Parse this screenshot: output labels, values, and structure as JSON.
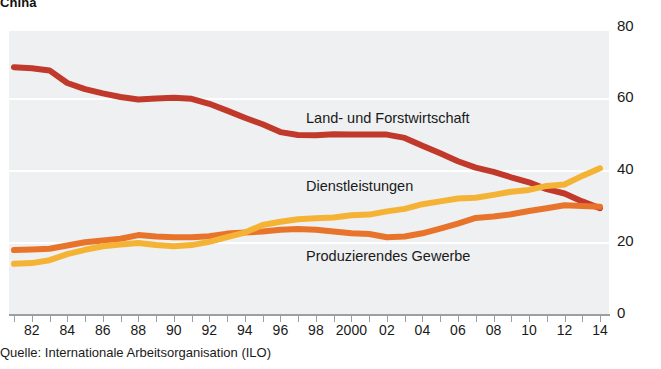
{
  "title": "China",
  "source_note": "Quelle: Internationale Arbeitsorganisation (ILO)",
  "series_labels": {
    "agriculture": "Land- und Forstwirtschaft",
    "services": "Dienstleistungen",
    "industry": "Produzierendes Gewerbe"
  },
  "colors": {
    "agriculture": "#c0392b",
    "services": "#f5b335",
    "industry": "#e8742c",
    "plot_background": "#eef0f1",
    "gridline": "#ffffff",
    "axis": "#9a9fa3"
  },
  "axes": {
    "y_ticks": [
      "80",
      "60",
      "40",
      "20",
      "0"
    ],
    "x_ticks": [
      "82",
      "84",
      "86",
      "88",
      "90",
      "92",
      "94",
      "96",
      "98",
      "2000",
      "02",
      "04",
      "06",
      "08",
      "10",
      "12",
      "14"
    ]
  },
  "chart_data": {
    "type": "line",
    "title": "China",
    "xlabel": "",
    "ylabel": "",
    "ylim": [
      0,
      80
    ],
    "grid": true,
    "legend_position": "inline-labels",
    "annotation": "Quelle: Internationale Arbeitsorganisation (ILO)",
    "x": [
      1981,
      1982,
      1983,
      1984,
      1985,
      1986,
      1987,
      1988,
      1989,
      1990,
      1991,
      1992,
      1993,
      1994,
      1995,
      1996,
      1997,
      1998,
      1999,
      2000,
      2001,
      2002,
      2003,
      2004,
      2005,
      2006,
      2007,
      2008,
      2009,
      2010,
      2011,
      2012,
      2013,
      2014
    ],
    "x_tick_labels": [
      "82",
      "84",
      "86",
      "88",
      "90",
      "92",
      "94",
      "96",
      "98",
      "2000",
      "02",
      "04",
      "06",
      "08",
      "10",
      "12",
      "14"
    ],
    "series": [
      {
        "name": "Land- und Forstwirtschaft",
        "color": "#c0392b",
        "values": [
          68.8,
          68.5,
          67.9,
          64.4,
          62.7,
          61.5,
          60.5,
          59.8,
          60.1,
          60.3,
          60.0,
          58.6,
          56.7,
          54.7,
          52.9,
          50.7,
          49.9,
          49.8,
          50.1,
          50.0,
          50.0,
          50.0,
          49.1,
          46.9,
          44.8,
          42.6,
          40.8,
          39.6,
          38.1,
          36.7,
          34.8,
          33.6,
          31.4,
          29.5
        ]
      },
      {
        "name": "Dienstleistungen",
        "color": "#f5b335",
        "values": [
          14.0,
          14.2,
          15.0,
          16.7,
          17.9,
          18.9,
          19.4,
          19.8,
          19.2,
          18.9,
          19.2,
          20.1,
          21.4,
          22.7,
          24.8,
          25.7,
          26.4,
          26.7,
          26.9,
          27.5,
          27.7,
          28.6,
          29.3,
          30.6,
          31.4,
          32.2,
          32.4,
          33.2,
          34.1,
          34.6,
          35.7,
          36.1,
          38.5,
          40.6
        ]
      },
      {
        "name": "Produzierendes Gewerbe",
        "color": "#e8742c",
        "values": [
          17.8,
          18.0,
          18.2,
          19.1,
          20.0,
          20.5,
          21.0,
          22.0,
          21.6,
          21.4,
          21.4,
          21.7,
          22.4,
          22.7,
          23.0,
          23.5,
          23.7,
          23.5,
          23.0,
          22.5,
          22.3,
          21.4,
          21.6,
          22.5,
          23.8,
          25.2,
          26.8,
          27.2,
          27.8,
          28.7,
          29.5,
          30.3,
          30.1,
          29.9
        ]
      }
    ]
  }
}
